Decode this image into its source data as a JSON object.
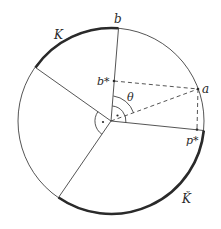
{
  "diagram": {
    "type": "geometric-circle-diagram",
    "labels": {
      "K": "K",
      "K_check": "Ǩ",
      "b": "b",
      "b_star": "b*",
      "a": "a",
      "p_star": "p*",
      "theta": "θ"
    },
    "colors": {
      "stroke": "#2a2a2a",
      "thick_arc": "#2a2a2a",
      "background": "#ffffff"
    },
    "geometry": {
      "center": [
        111,
        121
      ],
      "radius": 93
    },
    "right_angle_marks": [
      "•",
      "•"
    ]
  }
}
